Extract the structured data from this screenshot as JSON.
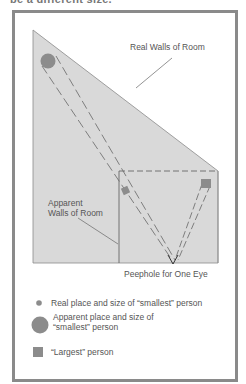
{
  "top_caption": "be a different size.",
  "diagram": {
    "labels": {
      "real_walls": "Real Walls of Room",
      "apparent_walls_line1": "Apparent",
      "apparent_walls_line2": "Walls of Room",
      "peephole": "Peephole for One Eye"
    },
    "colors": {
      "room_fill": "#d9d9d9",
      "lines": "#666666",
      "person_fill": "#8c8c8c",
      "frame": "#8a8a8a"
    }
  },
  "legend": {
    "items": [
      {
        "icon": "small-circle",
        "text": "Real place and size of “smallest” person"
      },
      {
        "icon": "large-circle",
        "text_line1": "Apparent place and size of",
        "text_line2": "“smallest” person"
      },
      {
        "icon": "square",
        "text": "“Largest” person"
      }
    ]
  }
}
